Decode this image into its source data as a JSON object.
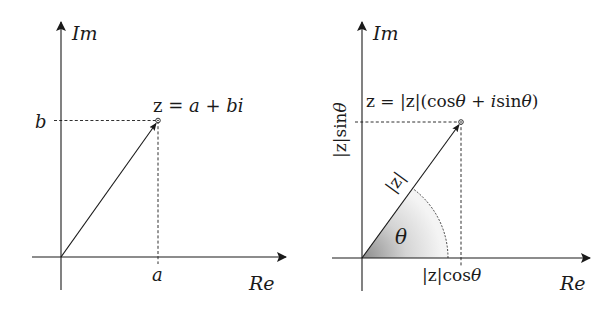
{
  "left_diagram": {
    "axis_y_label": "Im",
    "axis_x_label": "Re",
    "point_label": "z = a + bi",
    "point_label_parts": {
      "z": "z",
      "eq": " = ",
      "a": "a",
      "plus": " + ",
      "bi": "bi"
    },
    "tick_x_label": "a",
    "tick_y_label": "b"
  },
  "right_diagram": {
    "axis_y_label": "Im",
    "axis_x_label": "Re",
    "point_label": "z = |z|(cosθ + isinθ)",
    "point_label_parts": {
      "pre": "z = |z|(cos",
      "theta1": "θ",
      "plus": " + ",
      "i": "i",
      "sin": "sin",
      "theta2": "θ",
      "close": ")"
    },
    "vector_label": "|z|",
    "angle_label": "θ",
    "tick_x_label": "|z|cosθ",
    "tick_x_parts": {
      "pre": "|z|cos",
      "theta": "θ"
    },
    "tick_y_label": "|z|sinθ",
    "tick_y_parts": {
      "pre": "|z|sin",
      "theta": "θ"
    }
  },
  "colors": {
    "ink": "#1a1a1a",
    "background": "#ffffff",
    "shade_dark": "#8c8c8c",
    "shade_light": "#f2f2f2"
  }
}
